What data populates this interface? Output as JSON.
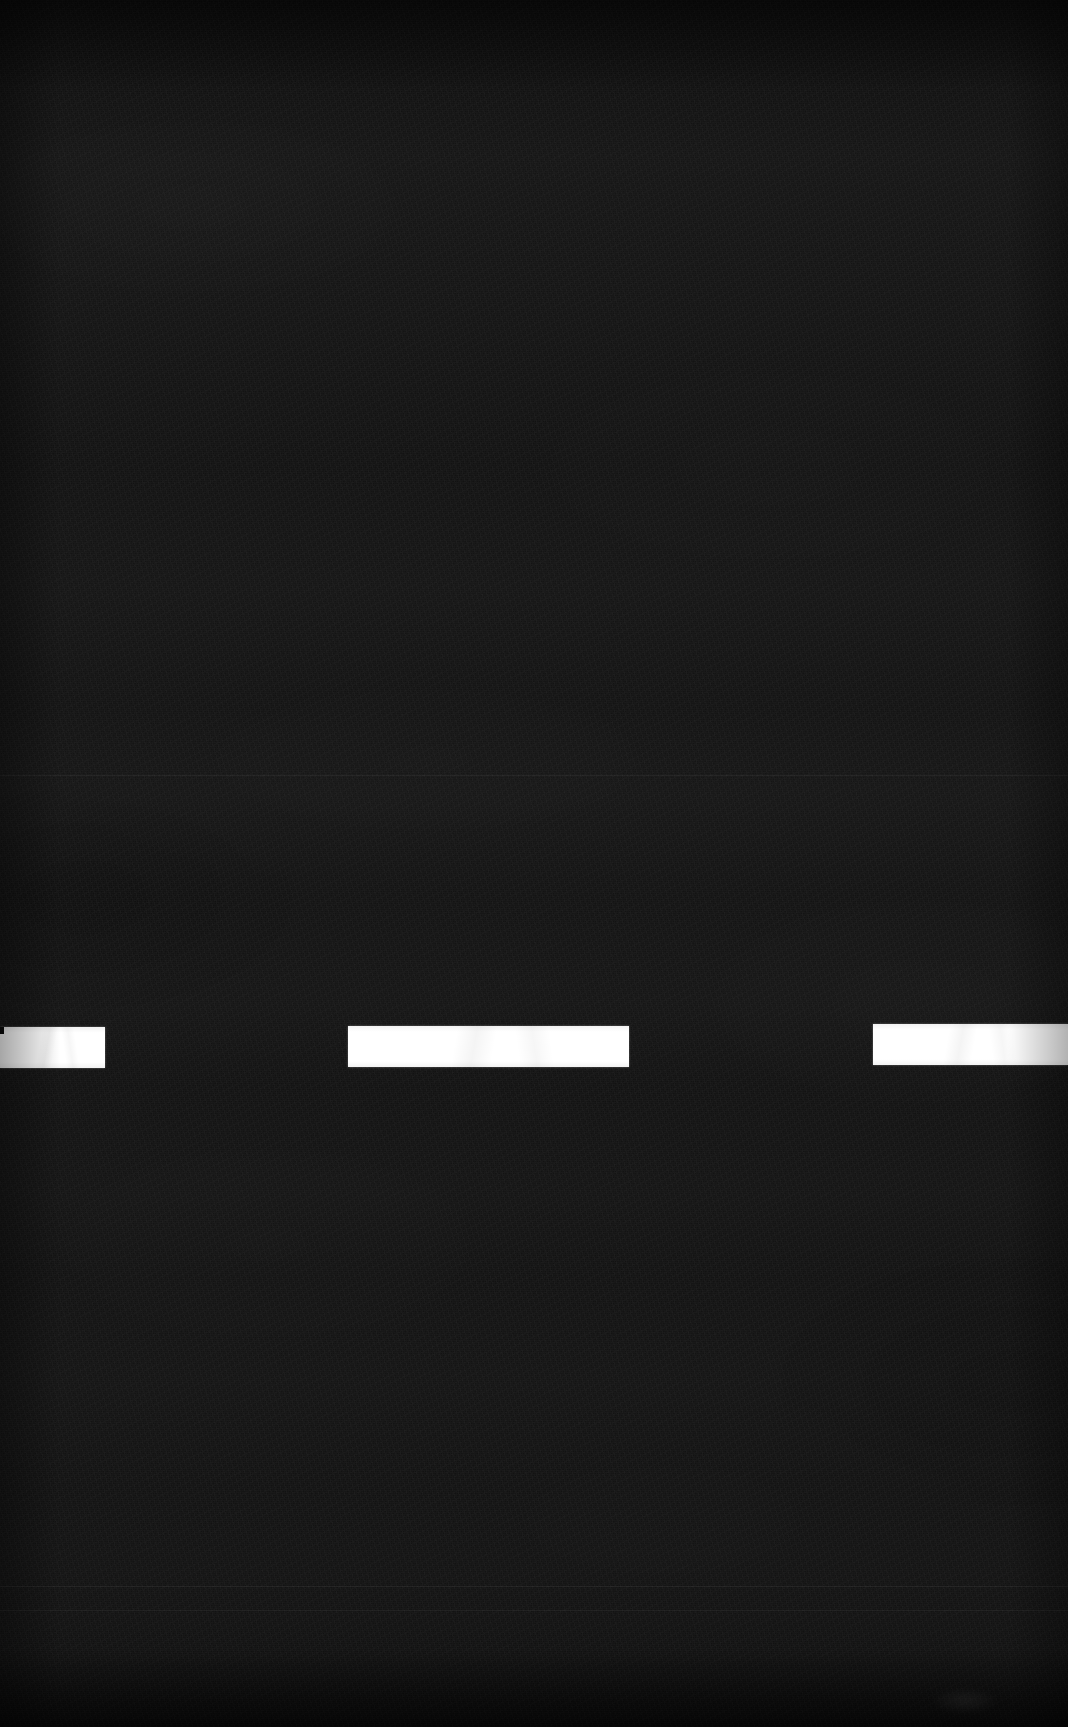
{
  "scene": {
    "name": "road-lane-marking",
    "description": "Night photograph of dark asphalt road surface with a broken white lane line crossing the lower third of the frame",
    "width_px": 1068,
    "height_px": 1727,
    "background_color": "#131313",
    "marking_color": "#ffffff",
    "noise": "film-grain"
  },
  "lane_line": {
    "label": "broken-white-lane-line",
    "stroke_color": "#ffffff",
    "dash_count": 3,
    "dashes": [
      {
        "id": "dash-left",
        "label": "dash 1",
        "x": 0,
        "y": 1027,
        "width": 105,
        "height": 41,
        "clipped": "left-edge"
      },
      {
        "id": "dash-center",
        "label": "dash 2",
        "x": 348,
        "y": 1026,
        "width": 281,
        "height": 41,
        "clipped": "none"
      },
      {
        "id": "dash-right",
        "label": "dash 3",
        "x": 873,
        "y": 1024,
        "width": 195,
        "height": 41,
        "clipped": "right-edge"
      }
    ]
  },
  "surface_marks": {
    "label": "faint-surface-seams",
    "scanlines": [
      {
        "id": "seam-upper",
        "y": 775
      },
      {
        "id": "seam-lower-a",
        "y": 1586
      },
      {
        "id": "seam-lower-b",
        "y": 1610
      }
    ],
    "smudge": {
      "id": "wear-smudge",
      "x": 930,
      "y": 1688,
      "width": 70,
      "height": 26
    }
  }
}
